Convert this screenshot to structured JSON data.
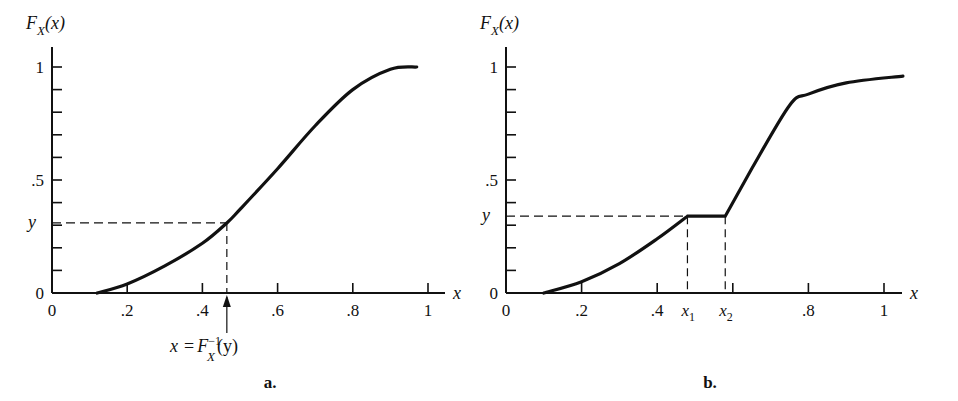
{
  "chart_data": [
    {
      "type": "line",
      "panel_label": "a.",
      "ylabel": "F_X(x)",
      "ylabel_main": "F",
      "ylabel_sub": "X",
      "ylabel_arg": "(x)",
      "xlabel": "x",
      "xlim": [
        0,
        1.05
      ],
      "ylim": [
        0,
        1
      ],
      "x_tick_labels": [
        "0",
        ".2",
        ".4",
        ".6",
        ".8",
        "1"
      ],
      "x_ticks": [
        0,
        0.2,
        0.4,
        0.6,
        0.8,
        1.0
      ],
      "y_tick_labels": [
        "0",
        ".5",
        "1"
      ],
      "y_ticks_minor_step": 0.1,
      "y_marker_label": "y",
      "y_marker_value": 0.31,
      "x_marker_value": 0.465,
      "annotation": "x = F_X^-1(y)",
      "annotation_parts": {
        "lhs": "x",
        "eq": "=",
        "F": "F",
        "sup": "−1",
        "sub": "X",
        "arg": "(y)"
      },
      "grid": false,
      "series": [
        {
          "name": "continuous strictly increasing CDF",
          "x": [
            0.12,
            0.2,
            0.3,
            0.4,
            0.465,
            0.5,
            0.6,
            0.7,
            0.8,
            0.9,
            0.97
          ],
          "y": [
            0.0,
            0.04,
            0.12,
            0.22,
            0.31,
            0.37,
            0.55,
            0.74,
            0.9,
            0.99,
            1.0
          ]
        }
      ]
    },
    {
      "type": "line",
      "panel_label": "b.",
      "ylabel": "F_X(x)",
      "ylabel_main": "F",
      "ylabel_sub": "X",
      "ylabel_arg": "(x)",
      "xlabel": "x",
      "xlim": [
        0,
        1.05
      ],
      "ylim": [
        0,
        1
      ],
      "x_tick_labels": [
        "0",
        ".2",
        ".4",
        ".8",
        "1"
      ],
      "x_ticks": [
        0,
        0.2,
        0.4,
        0.6,
        0.8,
        1.0
      ],
      "special_x_labels": [
        {
          "main": "x",
          "sub": "1",
          "value": 0.48
        },
        {
          "main": "x",
          "sub": "2",
          "value": 0.58
        }
      ],
      "y_tick_labels": [
        "0",
        ".5",
        "1"
      ],
      "y_ticks_minor_step": 0.1,
      "y_marker_label": "y",
      "y_marker_value": 0.34,
      "grid": false,
      "series": [
        {
          "name": "CDF with flat segment",
          "x": [
            0.1,
            0.2,
            0.3,
            0.4,
            0.48,
            0.58,
            0.65,
            0.75,
            0.8,
            0.9,
            1.05
          ],
          "y": [
            0.0,
            0.05,
            0.13,
            0.24,
            0.34,
            0.34,
            0.55,
            0.83,
            0.88,
            0.93,
            0.96
          ]
        }
      ]
    }
  ]
}
